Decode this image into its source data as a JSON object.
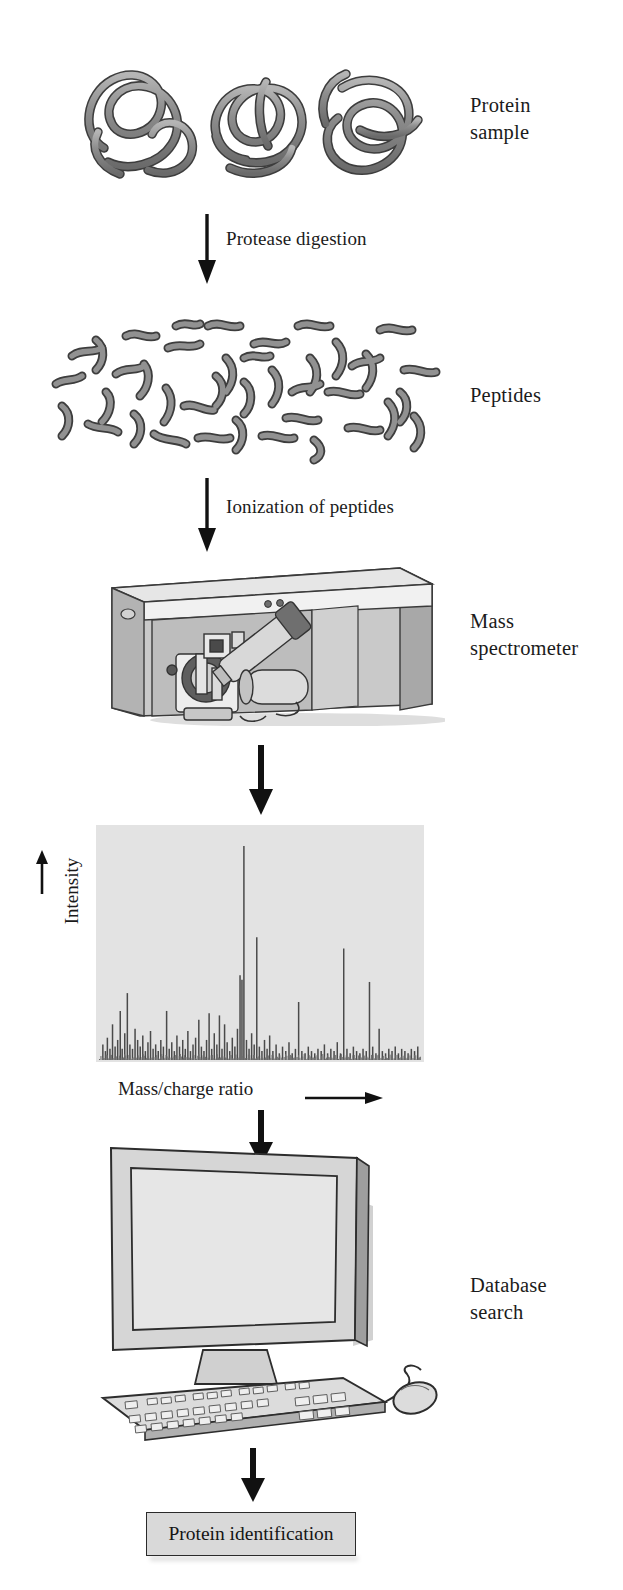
{
  "diagram": {
    "stages": [
      {
        "id": "protein-sample",
        "label": "Protein\nsample",
        "label_lines": [
          "Protein",
          "sample"
        ]
      },
      {
        "id": "peptides",
        "label": "Peptides",
        "label_lines": [
          "Peptides"
        ]
      },
      {
        "id": "mass-spectrometer",
        "label": "Mass\nspectrometer",
        "label_lines": [
          "Mass",
          "spectrometer"
        ]
      },
      {
        "id": "mass-spectrum",
        "label": "Mass\nspectrum",
        "label_lines": [
          "Mass",
          "spectrum"
        ]
      },
      {
        "id": "database-search",
        "label": "Database\nsearch",
        "label_lines": [
          "Database",
          "search"
        ]
      }
    ],
    "side_labels": {
      "protein_sample_line1": "Protein",
      "protein_sample_line2": "sample",
      "peptides": "Peptides",
      "mass_spectrometer_line1": "Mass",
      "mass_spectrometer_line2": "spectrometer",
      "mass_spectrum_line1": "Mass",
      "mass_spectrum_line2": "spectrum",
      "database_search_line1": "Database",
      "database_search_line2": "search"
    },
    "step_labels": {
      "protease_digestion": "Protease digestion",
      "ionization": "Ionization of peptides"
    },
    "result_box": {
      "label": "Protein identification"
    },
    "colors": {
      "ink": "#1b1b1b",
      "chain_fill": "#8c8c8c",
      "chain_stroke": "#3a3a3a",
      "panel_light": "#e3e3e3",
      "panel_mid": "#c6c6c6",
      "panel_dark": "#9a9a9a",
      "result_box_fill": "#d9d9d9",
      "arrow": "#111111"
    }
  },
  "chart_data": {
    "type": "bar",
    "xlabel": "Mass/charge ratio",
    "ylabel": "Intensity",
    "xlabel_suffix": "⟶",
    "ylabel_suffix": "↑",
    "grid": false,
    "legend": null,
    "xlim": [
      0,
      100
    ],
    "ylim": [
      0,
      100
    ],
    "axis_tick_labels": {
      "x": [],
      "y": []
    },
    "note": "Peak list as (x percent across axis, y percent of full intensity)",
    "peaks": [
      [
        1.2,
        7
      ],
      [
        2.0,
        4
      ],
      [
        2.6,
        10
      ],
      [
        3.4,
        5
      ],
      [
        4.2,
        16
      ],
      [
        5.0,
        6
      ],
      [
        5.8,
        9
      ],
      [
        6.6,
        22
      ],
      [
        7.2,
        5
      ],
      [
        8.0,
        12
      ],
      [
        8.8,
        30
      ],
      [
        9.6,
        7
      ],
      [
        10.4,
        5
      ],
      [
        11.2,
        14
      ],
      [
        12.0,
        9
      ],
      [
        12.8,
        6
      ],
      [
        13.6,
        11
      ],
      [
        14.4,
        4
      ],
      [
        15.2,
        8
      ],
      [
        16.0,
        13
      ],
      [
        16.8,
        5
      ],
      [
        17.6,
        7
      ],
      [
        18.4,
        4
      ],
      [
        19.2,
        9
      ],
      [
        20.0,
        6
      ],
      [
        21.0,
        22
      ],
      [
        21.8,
        5
      ],
      [
        22.6,
        8
      ],
      [
        23.4,
        4
      ],
      [
        24.2,
        11
      ],
      [
        25.0,
        6
      ],
      [
        26.0,
        9
      ],
      [
        26.8,
        5
      ],
      [
        27.6,
        13
      ],
      [
        28.4,
        4
      ],
      [
        29.2,
        7
      ],
      [
        30.0,
        10
      ],
      [
        31.0,
        18
      ],
      [
        31.8,
        6
      ],
      [
        32.6,
        4
      ],
      [
        33.4,
        9
      ],
      [
        34.2,
        21
      ],
      [
        35.0,
        5
      ],
      [
        35.8,
        12
      ],
      [
        36.6,
        7
      ],
      [
        37.4,
        20
      ],
      [
        38.2,
        5
      ],
      [
        39.0,
        16
      ],
      [
        39.8,
        8
      ],
      [
        40.6,
        4
      ],
      [
        41.4,
        10
      ],
      [
        42.2,
        6
      ],
      [
        43.0,
        14
      ],
      [
        43.8,
        38
      ],
      [
        44.4,
        36
      ],
      [
        45.0,
        96
      ],
      [
        45.8,
        9
      ],
      [
        46.6,
        5
      ],
      [
        47.4,
        12
      ],
      [
        48.2,
        7
      ],
      [
        49.0,
        55
      ],
      [
        49.8,
        6
      ],
      [
        50.6,
        4
      ],
      [
        51.4,
        9
      ],
      [
        52.2,
        5
      ],
      [
        53.0,
        11
      ],
      [
        54.0,
        4
      ],
      [
        55.0,
        7
      ],
      [
        56.0,
        3
      ],
      [
        57.0,
        6
      ],
      [
        58.0,
        4
      ],
      [
        59.0,
        8
      ],
      [
        60.0,
        3
      ],
      [
        61.0,
        5
      ],
      [
        62.0,
        26
      ],
      [
        63.0,
        4
      ],
      [
        64.0,
        3
      ],
      [
        65.0,
        6
      ],
      [
        66.0,
        4
      ],
      [
        67.0,
        3
      ],
      [
        68.0,
        5
      ],
      [
        69.0,
        4
      ],
      [
        70.0,
        7
      ],
      [
        71.0,
        3
      ],
      [
        72.0,
        5
      ],
      [
        73.0,
        4
      ],
      [
        74.0,
        8
      ],
      [
        75.0,
        3
      ],
      [
        76.0,
        50
      ],
      [
        77.0,
        5
      ],
      [
        78.0,
        3
      ],
      [
        79.0,
        6
      ],
      [
        80.0,
        4
      ],
      [
        81.0,
        3
      ],
      [
        82.0,
        5
      ],
      [
        83.0,
        4
      ],
      [
        84.0,
        35
      ],
      [
        85.0,
        6
      ],
      [
        86.0,
        3
      ],
      [
        87.0,
        14
      ],
      [
        88.0,
        4
      ],
      [
        89.0,
        3
      ],
      [
        90.0,
        5
      ],
      [
        91.0,
        4
      ],
      [
        92.0,
        6
      ],
      [
        93.0,
        3
      ],
      [
        94.0,
        5
      ],
      [
        95.0,
        4
      ],
      [
        96.0,
        3
      ],
      [
        97.0,
        5
      ],
      [
        98.0,
        4
      ],
      [
        99.0,
        6
      ]
    ]
  },
  "illustrations": {
    "protein_chains": {
      "count": 3,
      "description": "three tangled folded polypeptide chains"
    },
    "peptide_fragments": {
      "count": 52,
      "description": "scattered short rod-shaped peptide fragments"
    },
    "instrument": {
      "description": "benchtop mass spectrometer with open front panel showing internal ion optics"
    },
    "workstation": {
      "description": "CRT/LCD monitor with keyboard and mouse"
    }
  }
}
